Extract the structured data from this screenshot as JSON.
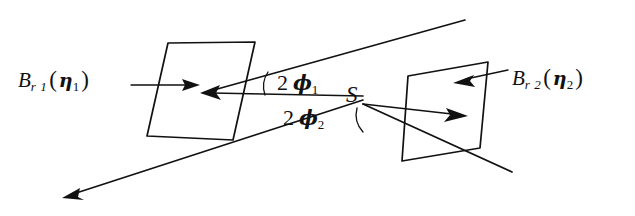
{
  "figure": {
    "background_color": "#ffffff",
    "stroke_color": "#111111",
    "labels": {
      "plane_left": {
        "symbol": "B",
        "subscript": "r 1",
        "open_paren": "(",
        "variable": "η",
        "variable_subscript": "1",
        "close_paren": ")",
        "full_text": "B r1 ( η1 )"
      },
      "plane_right": {
        "symbol": "B",
        "subscript": "r 2",
        "open_paren": "(",
        "variable": "η",
        "variable_subscript": "2",
        "close_paren": ")",
        "full_text": "B r2 ( η2 )"
      },
      "angle_upper": {
        "coefficient": "2",
        "variable": "ϕ",
        "subscript": "1",
        "full_text": "2 ϕ1"
      },
      "angle_lower": {
        "coefficient": "2",
        "variable": "ϕ",
        "subscript": "2",
        "full_text": "2 ϕ2"
      },
      "source_point": "S"
    },
    "geometry": {
      "plane_left": {
        "name": "left-parallelogram",
        "points": "168,43 255,42 233,140 147,136"
      },
      "plane_right": {
        "name": "right-parallelogram",
        "points": "408,76 488,62 480,148 402,161"
      },
      "ray_upper": {
        "name": "upper-divergent-ray",
        "from_x": 465,
        "from_y": 20,
        "to_x": 203,
        "to_y": 93
      },
      "ray_lower": {
        "name": "lower-divergent-ray",
        "from_x": 363,
        "from_y": 100,
        "to_x": 62,
        "to_y": 198
      },
      "ray_axis_left": {
        "name": "left-axis-ray",
        "from_x": 363,
        "from_y": 96,
        "to_x": 203,
        "to_y": 93
      },
      "ray_axis_right": {
        "name": "right-axis-ray",
        "from_x": 363,
        "from_y": 104,
        "to_x": 465,
        "to_y": 115
      },
      "ray_lower_right": {
        "name": "lower-right-ray",
        "from_x": 363,
        "from_y": 104,
        "to_x": 512,
        "to_y": 172
      },
      "leader_left": {
        "name": "left-label-leader",
        "from_x": 131,
        "from_y": 85,
        "to_x": 180,
        "to_y": 85
      },
      "leader_right": {
        "name": "right-label-leader",
        "from_x": 508,
        "from_y": 72,
        "to_x": 460,
        "to_y": 82
      },
      "arc_upper": {
        "name": "upper-angle-arc",
        "path": "M 268,72 A 26,26 0 0 0 265,95"
      },
      "arc_lower": {
        "name": "lower-angle-arc",
        "path": "M 357,108 A 26,26 0 0 0 363,132"
      }
    }
  }
}
